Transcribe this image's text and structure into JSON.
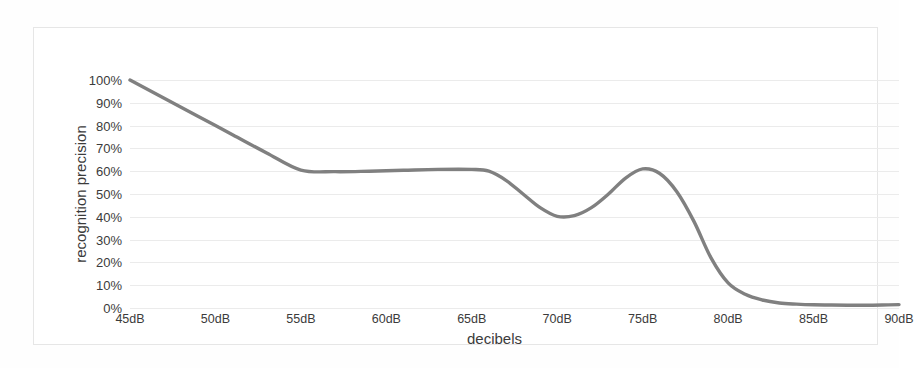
{
  "chart_data": {
    "type": "line",
    "title": "",
    "xlabel": "decibels",
    "ylabel": "recognition precision",
    "x_tick_labels": [
      "45dB",
      "50dB",
      "55dB",
      "60dB",
      "65dB",
      "70dB",
      "75dB",
      "80dB",
      "85dB",
      "90dB"
    ],
    "y_tick_labels": [
      "100%",
      "90%",
      "80%",
      "70%",
      "60%",
      "50%",
      "40%",
      "30%",
      "20%",
      "10%",
      "0%"
    ],
    "xlim": [
      45,
      90
    ],
    "ylim": [
      0,
      100
    ],
    "grid": true,
    "legend": "none",
    "line_color": "#808080",
    "grid_color": "#ebebeb",
    "x": [
      45,
      47,
      49,
      51,
      53,
      55,
      57,
      59,
      61,
      63,
      65,
      66,
      67,
      68,
      69,
      70,
      71,
      72,
      73,
      74,
      75,
      76,
      77,
      78,
      79,
      80,
      81,
      82,
      83,
      84,
      85,
      86,
      87,
      88,
      89,
      90
    ],
    "values": [
      100,
      92,
      84,
      76,
      68,
      60.5,
      59.8,
      60,
      60.4,
      60.8,
      60.8,
      60,
      56,
      50,
      44,
      40.2,
      40.5,
      44,
      50,
      57,
      61,
      59,
      51,
      38,
      22,
      11,
      6,
      3.5,
      2.2,
      1.7,
      1.4,
      1.3,
      1.2,
      1.2,
      1.3,
      1.5
    ],
    "series": [
      {
        "name": "recognition precision",
        "annotations": [
          {
            "label": "start",
            "x": 45,
            "y": 100
          },
          {
            "label": "plateau",
            "x": 60,
            "y": 60
          },
          {
            "label": "local-minimum",
            "x": 70,
            "y": 40
          },
          {
            "label": "local-maximum",
            "x": 75,
            "y": 61
          },
          {
            "label": "tail",
            "x": 90,
            "y": 1.5
          }
        ]
      }
    ]
  }
}
